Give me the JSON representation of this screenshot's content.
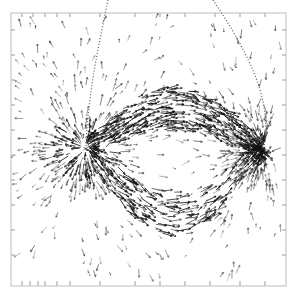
{
  "figure": {
    "type": "vector-field-plot",
    "frame": {
      "x0": 11,
      "y0": 13,
      "x1": 286,
      "y1": 286,
      "color": "#bdbdbd"
    },
    "ticks": {
      "top": [
        22,
        33,
        45,
        57,
        70,
        100,
        135,
        160,
        185,
        215,
        240,
        265
      ],
      "bottom": [
        22,
        30,
        38,
        45,
        57,
        70,
        100,
        135,
        160,
        185,
        210,
        240,
        265
      ],
      "left": [
        30,
        55,
        80,
        105,
        130,
        155,
        180,
        205,
        230,
        255
      ],
      "right": [
        30,
        55,
        80,
        105,
        130,
        155,
        180,
        205,
        230,
        255
      ]
    },
    "loop": {
      "style": "dotted",
      "color": "#555555",
      "path": "M108,0 C100,40 88,90 86,148 M213,0 C240,40 262,80 265,115 C267,130 264,140 262,150"
    },
    "sources": [
      {
        "name": "left-concentration",
        "x": 85,
        "y": 148,
        "strength": 1.0
      },
      {
        "name": "right-concentration",
        "x": 262,
        "y": 150,
        "strength": 0.9
      }
    ],
    "dense_band": {
      "from": [
        85,
        148
      ],
      "to": [
        262,
        150
      ],
      "curve_dip": 40
    },
    "arrow_color": "#333333",
    "dense_color": "#111111"
  }
}
